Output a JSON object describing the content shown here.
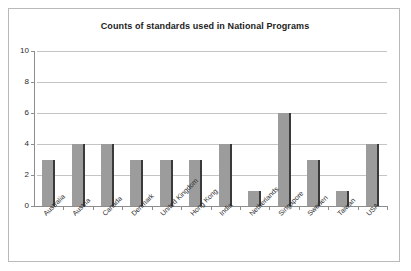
{
  "chart_data": {
    "type": "bar",
    "title": "Counts of standards used in National Programs",
    "xlabel": "",
    "ylabel": "",
    "categories": [
      "Australia",
      "Austria",
      "Canada",
      "Denmark",
      "United Kingdom",
      "Hong Kong",
      "India",
      "Netherlands",
      "Singapore",
      "Sweden",
      "Taiwan",
      "USA"
    ],
    "values": [
      3,
      4,
      4,
      3,
      3,
      3,
      4,
      1,
      6,
      3,
      1,
      4
    ],
    "ylim": [
      0,
      10
    ],
    "ytick_labels": [
      "0",
      "2",
      "4",
      "6",
      "8",
      "10"
    ],
    "ytick_values": [
      0,
      2,
      4,
      6,
      8,
      10
    ],
    "grid": true,
    "legend": false,
    "series": [
      {
        "name": "Counts of standards",
        "values": [
          3,
          4,
          4,
          3,
          3,
          3,
          4,
          1,
          6,
          3,
          1,
          4
        ]
      }
    ],
    "colors": {
      "bar_fill": "#9c9c9c",
      "bar_edge": "#3a3a3a",
      "gridline": "#c4c4c4",
      "axis": "#8d8d8d",
      "frame": "#b9b9b9",
      "text": "#2a2a2a",
      "background": "#ffffff"
    }
  }
}
